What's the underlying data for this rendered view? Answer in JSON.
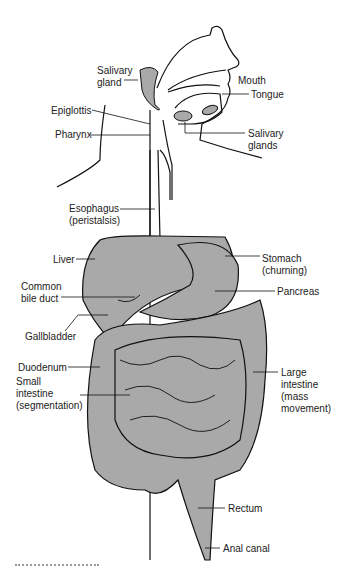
{
  "diagram": {
    "organ_fill": "#a9a9a9",
    "line_color": "#111111",
    "labels": [
      {
        "id": "salivary-gland",
        "text": "Salivary\ngland",
        "x": 97,
        "y": 65
      },
      {
        "id": "mouth",
        "text": "Mouth",
        "x": 238,
        "y": 75
      },
      {
        "id": "tongue",
        "text": "Tongue",
        "x": 251,
        "y": 89
      },
      {
        "id": "epiglottis",
        "text": "Epiglottis",
        "x": 51,
        "y": 105
      },
      {
        "id": "pharynx",
        "text": "Pharynx",
        "x": 55,
        "y": 129
      },
      {
        "id": "salivary-glands",
        "text": "Salivary\nglands",
        "x": 248,
        "y": 128
      },
      {
        "id": "esophagus",
        "text": "Esophagus\n(peristalsis)",
        "x": 69,
        "y": 203
      },
      {
        "id": "liver",
        "text": "Liver",
        "x": 53,
        "y": 254
      },
      {
        "id": "stomach",
        "text": "Stomach\n(churning)",
        "x": 262,
        "y": 253
      },
      {
        "id": "common-bile-duct",
        "text": "Common\nbile duct",
        "x": 21,
        "y": 281
      },
      {
        "id": "pancreas",
        "text": "Pancreas",
        "x": 277,
        "y": 286
      },
      {
        "id": "gallbladder",
        "text": "Gallbladder",
        "x": 25,
        "y": 331
      },
      {
        "id": "duodenum",
        "text": "Duodenum",
        "x": 18,
        "y": 362
      },
      {
        "id": "small-intestine",
        "text": "Small\nintestine\n(segmentation)",
        "x": 16,
        "y": 376
      },
      {
        "id": "large-intestine",
        "text": "Large\nintestine\n(mass\nmovement)",
        "x": 281,
        "y": 367
      },
      {
        "id": "rectum",
        "text": "Rectum",
        "x": 228,
        "y": 503
      },
      {
        "id": "anal-canal",
        "text": "Anal canal",
        "x": 223,
        "y": 543
      }
    ]
  }
}
